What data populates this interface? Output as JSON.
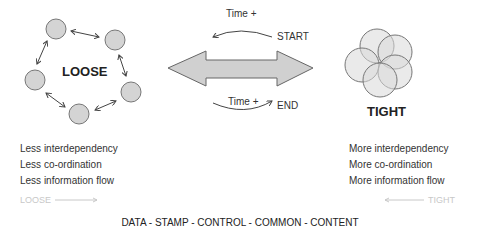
{
  "loose": {
    "title": "LOOSE",
    "items": [
      "Less interdependency",
      "Less co-ordination",
      "Less information flow"
    ],
    "direction_label": "LOOSE",
    "circles": [
      [
        56,
        29
      ],
      [
        115,
        40
      ],
      [
        35,
        80
      ],
      [
        131,
        92
      ],
      [
        79,
        114
      ]
    ]
  },
  "tight": {
    "title": "TIGHT",
    "items": [
      "More interdependency",
      "More co-ordination",
      "More information flow"
    ],
    "direction_label": "TIGHT",
    "circles": [
      [
        377,
        46
      ],
      [
        395,
        52
      ],
      [
        362,
        65
      ],
      [
        395,
        72
      ],
      [
        380,
        80
      ]
    ]
  },
  "center": {
    "top_time": "Time +",
    "start": "START",
    "bottom_time": "Time +",
    "end": "END"
  },
  "footer": "DATA - STAMP - CONTROL - COMMON - CONTENT",
  "colors": {
    "fill": "#d4d4d4",
    "stroke": "#777777"
  }
}
